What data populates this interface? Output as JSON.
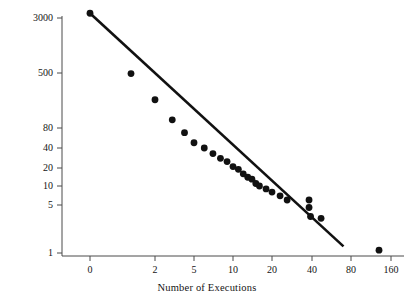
{
  "chart_data": {
    "type": "scatter",
    "title": "",
    "xlabel": "Number of Executions",
    "ylabel": "Number of Counties",
    "xscale": "log",
    "yscale": "log",
    "grid": false,
    "legend": "none",
    "xticks": [
      {
        "label": "0",
        "value": 0
      },
      {
        "label": "2",
        "value": 2
      },
      {
        "label": "5",
        "value": 5
      },
      {
        "label": "10",
        "value": 10
      },
      {
        "label": "20",
        "value": 20
      },
      {
        "label": "40",
        "value": 40
      },
      {
        "label": "80",
        "value": 80
      },
      {
        "label": "160",
        "value": 160
      }
    ],
    "yticks": [
      {
        "label": "3000",
        "value": 3000
      },
      {
        "label": "500",
        "value": 500
      },
      {
        "label": "80",
        "value": 80
      },
      {
        "label": "40",
        "value": 40
      },
      {
        "label": "20",
        "value": 20
      },
      {
        "label": "10",
        "value": 10
      },
      {
        "label": "5",
        "value": 5
      },
      {
        "label": "1",
        "value": 1
      }
    ],
    "xlim": [
      0,
      160
    ],
    "ylim": [
      1,
      3000
    ],
    "marker": {
      "shape": "circle",
      "color": "#111111",
      "size": 4.6
    },
    "fit_line": {
      "color": "#111111",
      "width": 2.6,
      "x_start": 0,
      "x_end": 70,
      "y_start": 3100,
      "y_end": 1.25
    },
    "points": [
      {
        "x": 0,
        "y": 3100
      },
      {
        "x": 1,
        "y": 490
      },
      {
        "x": 2,
        "y": 205
      },
      {
        "x": 3,
        "y": 105
      },
      {
        "x": 4,
        "y": 68
      },
      {
        "x": 5,
        "y": 48
      },
      {
        "x": 6,
        "y": 40
      },
      {
        "x": 7,
        "y": 33
      },
      {
        "x": 8,
        "y": 28
      },
      {
        "x": 9,
        "y": 25
      },
      {
        "x": 10,
        "y": 21
      },
      {
        "x": 11,
        "y": 19
      },
      {
        "x": 12,
        "y": 16
      },
      {
        "x": 13,
        "y": 14
      },
      {
        "x": 14,
        "y": 13
      },
      {
        "x": 15,
        "y": 11
      },
      {
        "x": 16,
        "y": 10
      },
      {
        "x": 18,
        "y": 9
      },
      {
        "x": 20,
        "y": 8
      },
      {
        "x": 23,
        "y": 7
      },
      {
        "x": 26,
        "y": 6
      },
      {
        "x": 38,
        "y": 6
      },
      {
        "x": 38,
        "y": 4.6
      },
      {
        "x": 39,
        "y": 3.4
      },
      {
        "x": 47,
        "y": 3.2
      },
      {
        "x": 130,
        "y": 1.1
      }
    ]
  },
  "axes": {
    "x_title": "Number of Executions",
    "y_title": "Number of Counties"
  }
}
